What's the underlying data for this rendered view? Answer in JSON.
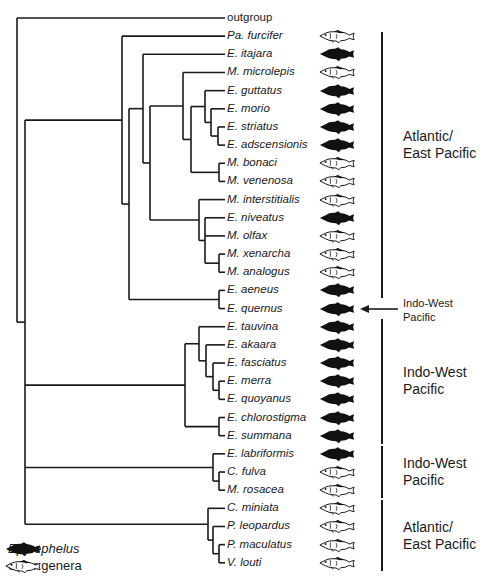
{
  "figure": {
    "tree": {
      "children": [
        {
          "name": "outgroup",
          "genus_type": "none"
        },
        {
          "children": [
            {
              "children": [
                {
                  "name": "Pa. furcifer",
                  "genus_type": "other"
                },
                {
                  "children": [
                    {
                      "children": [
                        {
                          "name": "E. itajara",
                          "genus_type": "epinephelus"
                        },
                        {
                          "children": [
                            {
                              "children": [
                                {
                                  "name": "M. microlepis",
                                  "genus_type": "other"
                                },
                                {
                                  "children": [
                                    {
                                      "children": [
                                        {
                                          "name": "E. guttatus",
                                          "genus_type": "epinephelus"
                                        },
                                        {
                                          "children": [
                                            {
                                              "name": "E. morio",
                                              "genus_type": "epinephelus"
                                            },
                                            {
                                              "children": [
                                                {
                                                  "name": "E. striatus",
                                                  "genus_type": "epinephelus"
                                                },
                                                {
                                                  "name": "E. adscensionis",
                                                  "genus_type": "epinephelus"
                                                }
                                              ]
                                            }
                                          ]
                                        }
                                      ]
                                    },
                                    {
                                      "children": [
                                        {
                                          "name": "M. bonaci",
                                          "genus_type": "other"
                                        },
                                        {
                                          "name": "M. venenosa",
                                          "genus_type": "other"
                                        }
                                      ]
                                    }
                                  ]
                                }
                              ]
                            },
                            {
                              "children": [
                                {
                                  "name": "M. interstitialis",
                                  "genus_type": "other"
                                },
                                {
                                  "children": [
                                    {
                                      "name": "E. niveatus",
                                      "genus_type": "epinephelus"
                                    },
                                    {
                                      "name": "M. olfax",
                                      "genus_type": "other"
                                    },
                                    {
                                      "children": [
                                        {
                                          "name": "M. xenarcha",
                                          "genus_type": "other"
                                        },
                                        {
                                          "name": "M. analogus",
                                          "genus_type": "other"
                                        }
                                      ]
                                    }
                                  ]
                                }
                              ]
                            }
                          ]
                        }
                      ]
                    },
                    {
                      "children": [
                        {
                          "name": "E. aeneus",
                          "genus_type": "epinephelus"
                        },
                        {
                          "name": "E. quernus",
                          "genus_type": "epinephelus"
                        }
                      ]
                    }
                  ]
                }
              ]
            },
            {
              "children": [
                {
                  "children": [
                    {
                      "name": "E. tauvina",
                      "genus_type": "epinephelus"
                    },
                    {
                      "children": [
                        {
                          "name": "E. akaara",
                          "genus_type": "epinephelus"
                        },
                        {
                          "children": [
                            {
                              "name": "E. fasciatus",
                              "genus_type": "epinephelus"
                            },
                            {
                              "children": [
                                {
                                  "name": "E. merra",
                                  "genus_type": "epinephelus"
                                },
                                {
                                  "name": "E. quoyanus",
                                  "genus_type": "epinephelus"
                                }
                              ]
                            }
                          ]
                        }
                      ]
                    }
                  ]
                },
                {
                  "children": [
                    {
                      "name": "E. chlorostigma",
                      "genus_type": "epinephelus"
                    },
                    {
                      "name": "E. summana",
                      "genus_type": "epinephelus"
                    }
                  ]
                }
              ]
            },
            {
              "children": [
                {
                  "name": "E. labriformis",
                  "genus_type": "epinephelus"
                },
                {
                  "children": [
                    {
                      "name": "C. fulva",
                      "genus_type": "other"
                    },
                    {
                      "name": "M. rosacea",
                      "genus_type": "other"
                    }
                  ]
                }
              ]
            },
            {
              "children": [
                {
                  "name": "C. miniata",
                  "genus_type": "other"
                },
                {
                  "children": [
                    {
                      "name": "P. leopardus",
                      "genus_type": "other"
                    },
                    {
                      "children": [
                        {
                          "name": "P. maculatus",
                          "genus_type": "other"
                        },
                        {
                          "name": "V. louti",
                          "genus_type": "other"
                        }
                      ]
                    }
                  ]
                }
              ]
            }
          ]
        }
      ]
    },
    "regions": [
      {
        "label_line1": "Atlantic/",
        "label_line2": "East Pacific",
        "from_taxon": "Pa. furcifer",
        "to_taxon": "E. aeneus"
      },
      {
        "label_line1": "Indo-West",
        "label_line2": "Pacific",
        "from_taxon": "E. quernus",
        "to_taxon": "E. quernus",
        "arrow": true
      },
      {
        "label_line1": "Indo-West",
        "label_line2": "Pacific",
        "from_taxon": "E. tauvina",
        "to_taxon": "E. summana"
      },
      {
        "label_line1": "Indo-West",
        "label_line2": "Pacific",
        "from_taxon": "E. labriformis",
        "to_taxon": "M. rosacea"
      },
      {
        "label_line1": "Atlantic/",
        "label_line2": "East Pacific",
        "from_taxon": "C. miniata",
        "to_taxon": "V. louti"
      }
    ],
    "legend": [
      {
        "icon": "fish-filled-icon",
        "label": "Epinephelus",
        "italic": true
      },
      {
        "icon": "fish-outline-icon",
        "label": "other genera",
        "italic": false
      }
    ],
    "colors": {
      "line": "#1a1a1a",
      "fish_fill": "#111111",
      "background": "#ffffff"
    }
  }
}
